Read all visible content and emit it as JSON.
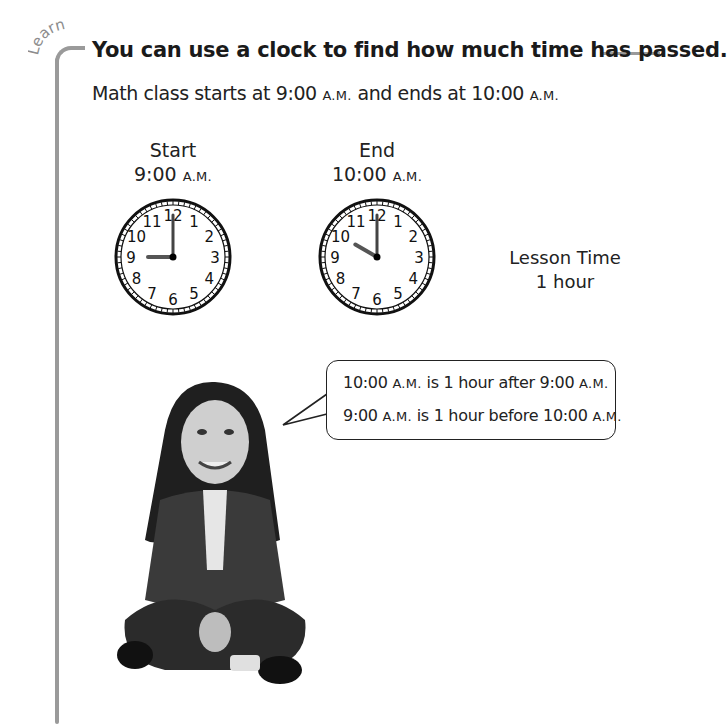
{
  "section_label": "Learn",
  "title": "You can use a clock to find how much time has passed.",
  "intro": {
    "text_before": "Math class starts at 9:00 ",
    "am1": "A.M.",
    "text_middle": " and ends at 10:00 ",
    "am2": "A.M."
  },
  "clocks": [
    {
      "label": "Start",
      "time": "9:00 ",
      "period": "A.M.",
      "hour_hand_target": 9,
      "minute_hand_target": 12
    },
    {
      "label": "End",
      "time": "10:00 ",
      "period": "A.M.",
      "hour_hand_target": 10,
      "minute_hand_target": 12
    }
  ],
  "clock_numbers": [
    "12",
    "1",
    "2",
    "3",
    "4",
    "5",
    "6",
    "7",
    "8",
    "9",
    "10",
    "11"
  ],
  "lesson": {
    "label": "Lesson Time",
    "value": "1 hour"
  },
  "speech_bubble": {
    "line1": {
      "a": "10:00 ",
      "am_a": "A.M.",
      "b": " is 1 hour after 9:00 ",
      "am_b": "A.M."
    },
    "line2": {
      "a": "9:00 ",
      "am_a": "A.M.",
      "b": " is 1 hour before 10:00 ",
      "am_b": "A.M."
    }
  },
  "image": {
    "description": "Smiling girl with long dark hair in a denim jacket sitting cross-legged"
  },
  "colors": {
    "bracket": "#9a9a9a",
    "text": "#1a1a1a"
  }
}
